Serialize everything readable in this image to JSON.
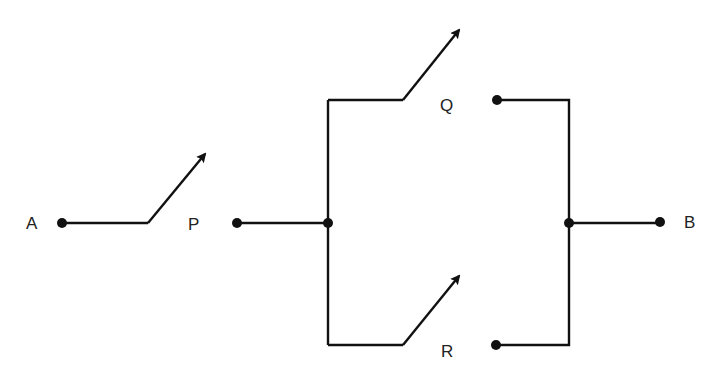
{
  "diagram": {
    "type": "switch-circuit",
    "colors": {
      "line": "#111111",
      "label": "#222222",
      "background": "#ffffff"
    },
    "labels": {
      "A": "A",
      "P": "P",
      "Q": "Q",
      "R": "R",
      "B": "B"
    },
    "nodes": [
      {
        "id": "A",
        "x": 62,
        "y": 223
      },
      {
        "id": "P",
        "x": 237,
        "y": 223
      },
      {
        "id": "junction-left",
        "x": 328,
        "y": 223
      },
      {
        "id": "Q",
        "x": 497,
        "y": 100
      },
      {
        "id": "R",
        "x": 496,
        "y": 345
      },
      {
        "id": "junction-right",
        "x": 569,
        "y": 223
      },
      {
        "id": "B",
        "x": 660,
        "y": 222
      }
    ],
    "switches": [
      {
        "id": "switch-A-P",
        "between": [
          "A",
          "P"
        ],
        "state": "open"
      },
      {
        "id": "switch-Q",
        "between": [
          "junction-left",
          "Q"
        ],
        "state": "open"
      },
      {
        "id": "switch-R",
        "between": [
          "junction-left",
          "R"
        ],
        "state": "open"
      }
    ]
  }
}
